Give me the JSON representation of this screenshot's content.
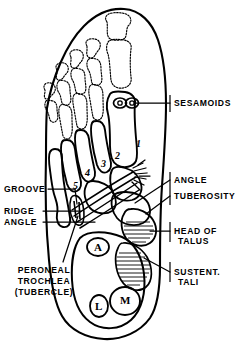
{
  "figure": {
    "ink_color": "#000000",
    "background_color": "#ffffff"
  },
  "labels": {
    "sesamoids": "SESAMOIDS",
    "groove": "GROOVE",
    "ridge": "RIDGE",
    "angle_left": "ANGLE",
    "angle_right": "ANGLE",
    "tuberosity": "TUBEROSITY",
    "head_of": "HEAD OF",
    "talus": "TALUS",
    "sustent": "SUSTENT.",
    "tali": "TALI",
    "peroneal": "PERONEAL",
    "trochlea": "TROCHLEA",
    "tubercle": "(TUBERCLE)"
  },
  "metatarsal_numbers": [
    "1",
    "2",
    "3",
    "4",
    "5"
  ],
  "calcaneal_letters": [
    "A",
    "L",
    "M"
  ]
}
